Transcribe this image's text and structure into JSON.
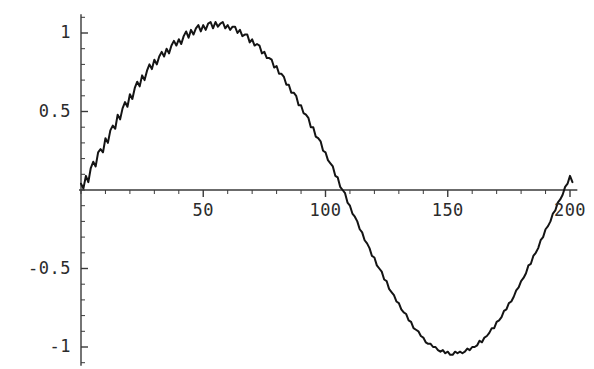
{
  "chart_data": {
    "type": "line",
    "title": "",
    "subtitle": "",
    "xlabel": "",
    "ylabel": "",
    "xlim": [
      0,
      203
    ],
    "ylim": [
      -1.12,
      1.12
    ],
    "grid": false,
    "legend": null,
    "x_tick_labels": [
      "50",
      "100",
      "150",
      "200"
    ],
    "x_tick_values": [
      50,
      100,
      150,
      200
    ],
    "x_minor_tick_step": 10,
    "y_tick_labels": [
      "1",
      "0.5",
      "-0.5",
      "-1"
    ],
    "y_tick_values": [
      1,
      0.5,
      -0.5,
      -1
    ],
    "y_minor_tick_step": 0.1,
    "axis_color": "#3a3a3a",
    "line_color": "#141414",
    "line_width": 2,
    "background": "#ffffff",
    "series": [
      {
        "name": "noisy sine",
        "x": [
          0,
          1,
          2,
          3,
          4,
          5,
          6,
          7,
          8,
          9,
          10,
          11,
          12,
          13,
          14,
          15,
          16,
          17,
          18,
          19,
          20,
          21,
          22,
          23,
          24,
          25,
          26,
          27,
          28,
          29,
          30,
          31,
          32,
          33,
          34,
          35,
          36,
          37,
          38,
          39,
          40,
          41,
          42,
          43,
          44,
          45,
          46,
          47,
          48,
          49,
          50,
          51,
          52,
          53,
          54,
          55,
          56,
          57,
          58,
          59,
          60,
          61,
          62,
          63,
          64,
          65,
          66,
          67,
          68,
          69,
          70,
          71,
          72,
          73,
          74,
          75,
          76,
          77,
          78,
          79,
          80,
          81,
          82,
          83,
          84,
          85,
          86,
          87,
          88,
          89,
          90,
          91,
          92,
          93,
          94,
          95,
          96,
          97,
          98,
          99,
          100,
          101,
          102,
          103,
          104,
          105,
          106,
          107,
          108,
          109,
          110,
          111,
          112,
          113,
          114,
          115,
          116,
          117,
          118,
          119,
          120,
          121,
          122,
          123,
          124,
          125,
          126,
          127,
          128,
          129,
          130,
          131,
          132,
          133,
          134,
          135,
          136,
          137,
          138,
          139,
          140,
          141,
          142,
          143,
          144,
          145,
          146,
          147,
          148,
          149,
          150,
          151,
          152,
          153,
          154,
          155,
          156,
          157,
          158,
          159,
          160,
          161,
          162,
          163,
          164,
          165,
          166,
          167,
          168,
          169,
          170,
          171,
          172,
          173,
          174,
          175,
          176,
          177,
          178,
          179,
          180,
          181,
          182,
          183,
          184,
          185,
          186,
          187,
          188,
          189,
          190,
          191,
          192,
          193,
          194,
          195,
          196,
          197,
          198,
          199,
          200,
          201
        ],
        "y": [
          0.04,
          0.01,
          0.09,
          0.05,
          0.14,
          0.18,
          0.15,
          0.24,
          0.26,
          0.24,
          0.33,
          0.3,
          0.38,
          0.41,
          0.39,
          0.48,
          0.45,
          0.52,
          0.56,
          0.53,
          0.61,
          0.58,
          0.65,
          0.69,
          0.66,
          0.73,
          0.7,
          0.76,
          0.8,
          0.77,
          0.83,
          0.8,
          0.85,
          0.88,
          0.85,
          0.9,
          0.87,
          0.92,
          0.95,
          0.92,
          0.96,
          0.93,
          0.98,
          1.01,
          0.97,
          1.02,
          0.99,
          1.03,
          1.05,
          1.01,
          1.05,
          1.02,
          1.06,
          1.07,
          1.03,
          1.07,
          1.04,
          1.06,
          1.07,
          1.03,
          1.05,
          1.02,
          1.04,
          1.04,
          1.0,
          1.02,
          0.98,
          0.99,
          0.99,
          0.94,
          0.96,
          0.92,
          0.93,
          0.92,
          0.87,
          0.88,
          0.84,
          0.84,
          0.83,
          0.78,
          0.79,
          0.74,
          0.74,
          0.72,
          0.67,
          0.67,
          0.62,
          0.62,
          0.6,
          0.54,
          0.54,
          0.49,
          0.48,
          0.46,
          0.4,
          0.4,
          0.34,
          0.33,
          0.31,
          0.25,
          0.24,
          0.19,
          0.17,
          0.15,
          0.09,
          0.08,
          0.02,
          0.0,
          -0.02,
          -0.08,
          -0.1,
          -0.15,
          -0.17,
          -0.2,
          -0.25,
          -0.27,
          -0.32,
          -0.34,
          -0.37,
          -0.42,
          -0.43,
          -0.48,
          -0.5,
          -0.52,
          -0.57,
          -0.58,
          -0.63,
          -0.65,
          -0.67,
          -0.71,
          -0.72,
          -0.76,
          -0.78,
          -0.79,
          -0.83,
          -0.84,
          -0.88,
          -0.89,
          -0.9,
          -0.93,
          -0.94,
          -0.97,
          -0.98,
          -0.98,
          -1.0,
          -1.0,
          -1.02,
          -1.03,
          -1.02,
          -1.04,
          -1.03,
          -1.05,
          -1.05,
          -1.03,
          -1.04,
          -1.03,
          -1.04,
          -1.03,
          -1.01,
          -1.02,
          -1.0,
          -1.0,
          -0.99,
          -0.96,
          -0.97,
          -0.94,
          -0.93,
          -0.91,
          -0.88,
          -0.88,
          -0.84,
          -0.83,
          -0.81,
          -0.77,
          -0.76,
          -0.72,
          -0.71,
          -0.68,
          -0.64,
          -0.62,
          -0.58,
          -0.56,
          -0.53,
          -0.48,
          -0.47,
          -0.42,
          -0.4,
          -0.37,
          -0.32,
          -0.3,
          -0.25,
          -0.23,
          -0.2,
          -0.15,
          -0.13,
          -0.08,
          -0.06,
          -0.03,
          0.02,
          0.04,
          0.09,
          0.05
        ]
      }
    ]
  },
  "axes": {
    "y_labels": [
      {
        "text": "1",
        "value": 1
      },
      {
        "text": "0.5",
        "value": 0.5
      },
      {
        "text": "-0.5",
        "value": -0.5
      },
      {
        "text": "-1",
        "value": -1
      }
    ],
    "x_labels": [
      {
        "text": "50",
        "value": 50
      },
      {
        "text": "100",
        "value": 100
      },
      {
        "text": "150",
        "value": 150
      },
      {
        "text": "200",
        "value": 200
      }
    ]
  }
}
